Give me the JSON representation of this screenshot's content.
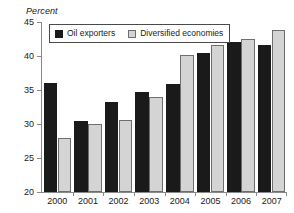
{
  "chart_data": {
    "type": "bar",
    "title": "",
    "ylabel": "Percent",
    "xlabel": "",
    "ylim": [
      20,
      45
    ],
    "yticks": [
      20,
      25,
      30,
      35,
      40,
      45
    ],
    "grid": false,
    "legend_position": "top-left-inside",
    "categories": [
      "2000",
      "2001",
      "2002",
      "2003",
      "2004",
      "2005",
      "2006",
      "2007"
    ],
    "series": [
      {
        "name": "Oil exporters",
        "color": "#1a1a1a",
        "values": [
          36.0,
          30.5,
          33.2,
          34.7,
          35.9,
          40.5,
          42.0,
          41.6
        ]
      },
      {
        "name": "Diversified economies",
        "color": "#d4d4d4",
        "values": [
          28.0,
          30.0,
          30.6,
          33.9,
          40.2,
          41.6,
          42.5,
          43.8
        ]
      }
    ]
  }
}
